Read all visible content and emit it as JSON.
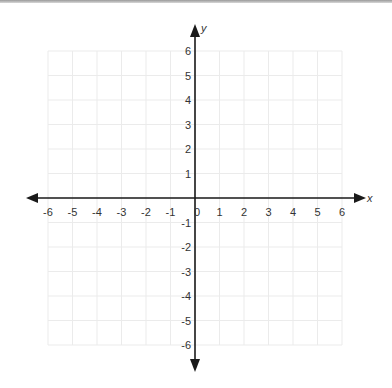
{
  "chart_data": {
    "type": "scatter",
    "title": "",
    "xlabel": "x",
    "ylabel": "y",
    "xlim": [
      -6,
      6
    ],
    "ylim": [
      -6,
      6
    ],
    "grid": true,
    "x_ticks": [
      "-6",
      "-5",
      "-4",
      "-3",
      "-2",
      "-1",
      "0",
      "1",
      "2",
      "3",
      "4",
      "5",
      "6"
    ],
    "y_ticks": [
      "6",
      "5",
      "4",
      "3",
      "2",
      "1",
      "-1",
      "-2",
      "-3",
      "-4",
      "-5",
      "-6"
    ],
    "series": [],
    "legend": null
  },
  "colors": {
    "grid": "#ebebeb",
    "axis": "#1a1a1a",
    "text": "#333333"
  }
}
